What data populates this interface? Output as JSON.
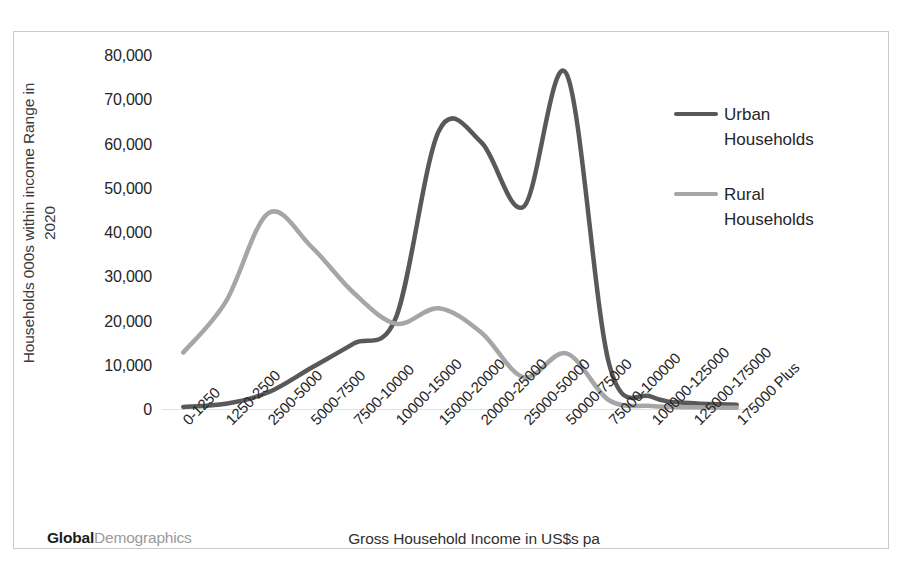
{
  "brand": {
    "strong": "Global",
    "light": "Demographics"
  },
  "legend": {
    "position": "right",
    "entries": [
      {
        "label_line1": "Urban",
        "label_line2": "Households",
        "color": "#595959"
      },
      {
        "label_line1": "Rural",
        "label_line2": "Households",
        "color": "#a6a6a6"
      }
    ]
  },
  "axis": {
    "y_title_line1": "Households 000s within income Range in",
    "y_title_line2": "2020",
    "x_title": "Gross Household Income in US$s pa",
    "y_ticks": [
      "80,000",
      "70,000",
      "60,000",
      "50,000",
      "40,000",
      "30,000",
      "20,000",
      "10,000",
      "0"
    ]
  },
  "chart_data": {
    "type": "line",
    "title": "",
    "xlabel": "Gross Household Income in US$s pa",
    "ylabel": "Households 000s within income Range in 2020",
    "ylim": [
      0,
      80000
    ],
    "ytick_values": [
      0,
      10000,
      20000,
      30000,
      40000,
      50000,
      60000,
      70000,
      80000
    ],
    "grid": false,
    "legend_position": "right",
    "smoothing": "spline",
    "categories": [
      "0-1250",
      "1250-2500",
      "2500-5000",
      "5000-7500",
      "7500-10000",
      "10000-15000",
      "15000-20000",
      "20000-25000",
      "25000-50000",
      "50000-75000",
      "75000-100000",
      "100000-125000",
      "125000-175000",
      "175000 Plus"
    ],
    "series": [
      {
        "name": "Urban Households",
        "color": "#595959",
        "values": [
          700,
          1400,
          4000,
          9500,
          15000,
          21000,
          63000,
          60500,
          46000,
          76000,
          10500,
          3000,
          1500,
          1200
        ]
      },
      {
        "name": "Rural Households",
        "color": "#a6a6a6",
        "values": [
          13000,
          24500,
          44500,
          37000,
          26500,
          19500,
          23000,
          17500,
          7400,
          12800,
          2200,
          900,
          600,
          500
        ]
      }
    ]
  }
}
